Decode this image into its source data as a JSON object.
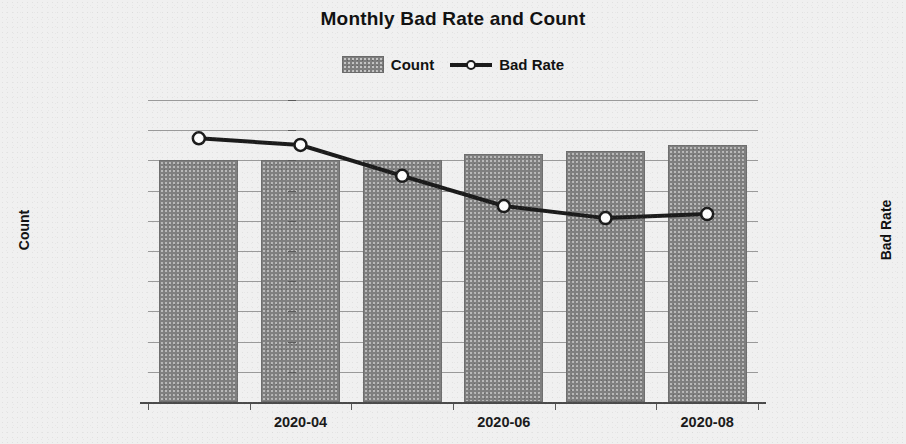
{
  "chart_data": {
    "type": "bar",
    "title": "Monthly Bad Rate and Count",
    "xlabel": "",
    "ylabel": "Count",
    "y2label": "Bad Rate",
    "categories": [
      "2020-03",
      "2020-04",
      "2020-05",
      "2020-06",
      "2020-07",
      "2020-08"
    ],
    "x_tick_labels": [
      "2020-04",
      "2020-06",
      "2020-08"
    ],
    "x_tick_label_indices": [
      1,
      3,
      5
    ],
    "ylim": [
      0,
      10000000
    ],
    "y2lim": [
      0,
      0.045
    ],
    "y_tick_labels": [
      "10000000",
      "9000000",
      "8000000",
      "7000000",
      "6000000",
      "5000000",
      "4000000",
      "3000000",
      "2000000",
      "1000000",
      "0"
    ],
    "y_tick_values": [
      10000000,
      9000000,
      8000000,
      7000000,
      6000000,
      5000000,
      4000000,
      3000000,
      2000000,
      1000000,
      0
    ],
    "y2_tick_labels": [
      "4.50%",
      "4.00%",
      "3.50%",
      "3.00%",
      "2.50%",
      "2.00%",
      "1.50%",
      "1.00%",
      "0.50%",
      "0.00%"
    ],
    "y2_tick_values": [
      0.045,
      0.04,
      0.035,
      0.03,
      0.025,
      0.02,
      0.015,
      0.01,
      0.005,
      0
    ],
    "grid": true,
    "legend_position": "top-center",
    "series": [
      {
        "name": "Count",
        "type": "bar",
        "axis": "left",
        "color": "#7f7f7f",
        "values": [
          8000000,
          8000000,
          8000000,
          8200000,
          8300000,
          8500000
        ]
      },
      {
        "name": "Bad Rate",
        "type": "line",
        "axis": "right",
        "color": "#1b1b1b",
        "marker_color": "#fdfdfd",
        "values": [
          0.0393,
          0.0383,
          0.0337,
          0.0292,
          0.0274,
          0.028
        ]
      }
    ]
  },
  "legend": {
    "items": [
      {
        "label": "Count",
        "kind": "bar-swatch"
      },
      {
        "label": "Bad Rate",
        "kind": "line-swatch"
      }
    ]
  }
}
